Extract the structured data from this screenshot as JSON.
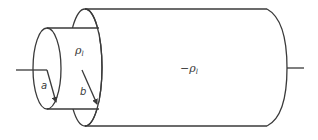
{
  "diagram": {
    "labels": {
      "inner_density": "ρ",
      "inner_density_sub": "l",
      "outer_density": "−ρ",
      "outer_density_sub": "l",
      "inner_radius": "a",
      "outer_radius": "b"
    },
    "colors": {
      "stroke": "#3a3a3a",
      "background": "#ffffff"
    }
  }
}
